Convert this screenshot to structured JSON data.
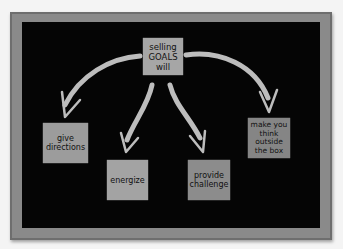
{
  "diagram": {
    "center": {
      "label_lines": [
        "selling",
        "GOALS",
        "will"
      ]
    },
    "outcomes": [
      {
        "label_lines": [
          "give",
          "directions"
        ]
      },
      {
        "label_lines": [
          "energize"
        ]
      },
      {
        "label_lines": [
          "provide",
          "challenge"
        ]
      },
      {
        "label_lines": [
          "make you",
          "think",
          "outside",
          "the box"
        ]
      }
    ],
    "colors": {
      "board": "#050505",
      "frame": "#8a8a8a",
      "note": "#9c9c9c",
      "arrow": "#bdbdbd",
      "background": "#f4f4f4"
    }
  }
}
